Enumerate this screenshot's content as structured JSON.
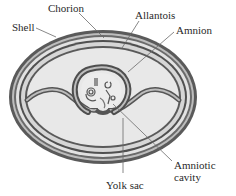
{
  "diagram": {
    "type": "amniotic egg cross-section",
    "colors": {
      "dark_band": "#555555",
      "mid_band": "#8a8a8a",
      "light_band": "#d4d4d4",
      "interior": "#e6e6e6",
      "leader_line": "#6a6a6a",
      "text": "#2a2a2a"
    }
  },
  "labels": {
    "shell": "Shell",
    "chorion": "Chorion",
    "allantois": "Allantois",
    "amnion": "Amnion",
    "amniotic_cavity_line1": "Amniotic",
    "amniotic_cavity_line2": "cavity",
    "yolk_sac": "Yolk sac"
  }
}
